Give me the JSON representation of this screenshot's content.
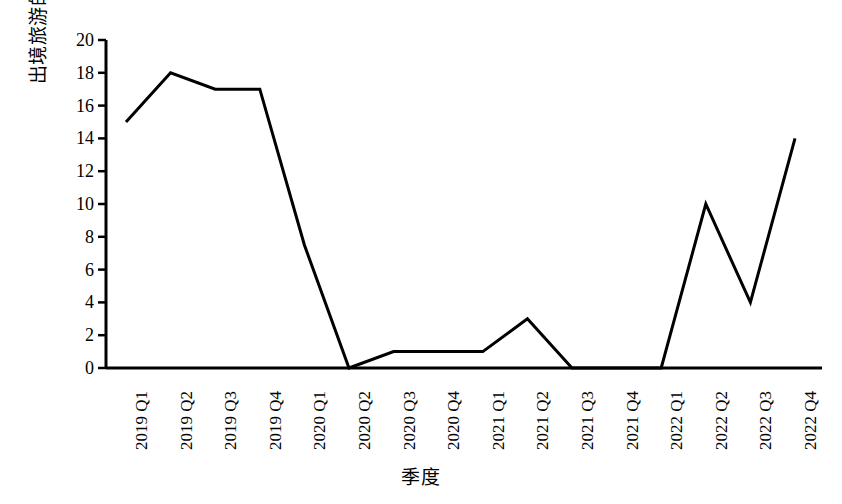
{
  "chart_data": {
    "type": "line",
    "title": "",
    "xlabel": "季度",
    "ylabel": "出境旅游的人数比例/%",
    "categories": [
      "2019 Q1",
      "2019 Q2",
      "2019 Q3",
      "2019 Q4",
      "2020 Q1",
      "2020 Q2",
      "2020 Q3",
      "2020 Q4",
      "2021 Q1",
      "2021 Q2",
      "2021 Q3",
      "2021 Q4",
      "2022 Q1",
      "2022 Q2",
      "2022 Q3",
      "2022 Q4"
    ],
    "values": [
      15,
      18,
      17,
      17,
      7.5,
      0,
      1,
      1,
      1,
      3,
      0,
      0,
      0,
      10,
      4,
      14
    ],
    "ylim": [
      0,
      20
    ],
    "y_ticks": [
      0,
      2,
      4,
      6,
      8,
      10,
      12,
      14,
      16,
      18,
      20
    ],
    "y_tick_labels": [
      "0",
      "2",
      "4",
      "6",
      "8",
      "10",
      "12",
      "14",
      "16",
      "18",
      "20"
    ],
    "grid": false,
    "legend": false,
    "legend_position": "none",
    "series_color": "#000000",
    "axis_color": "#000000",
    "background_color": "#ffffff",
    "line_width": 3
  }
}
